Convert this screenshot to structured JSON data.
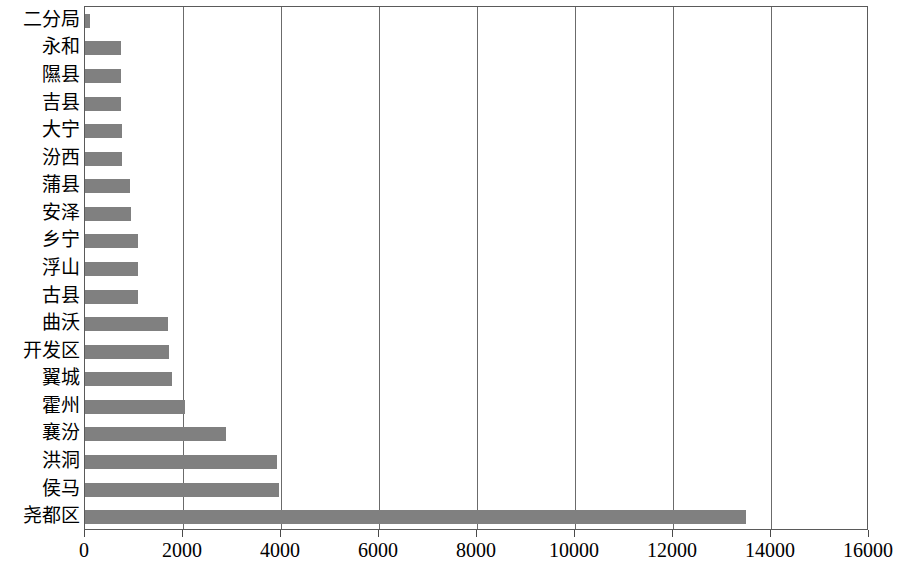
{
  "chart_data": {
    "type": "bar",
    "orientation": "horizontal",
    "title": "",
    "subtitle": "",
    "xlabel": "",
    "ylabel": "",
    "categories": [
      "二分局",
      "永和",
      "隰县",
      "吉县",
      "大宁",
      "汾西",
      "蒲县",
      "安泽",
      "乡宁",
      "浮山",
      "古县",
      "曲沃",
      "开发区",
      "翼城",
      "霍州",
      "襄汾",
      "洪洞",
      "侯马",
      "尧都区"
    ],
    "values": [
      110,
      735,
      740,
      740,
      745,
      745,
      925,
      930,
      1080,
      1085,
      1090,
      1700,
      1710,
      1780,
      2050,
      2880,
      3920,
      3960,
      13490
    ],
    "xlim": [
      0,
      16000
    ],
    "ylim": null,
    "xticks": [
      0,
      2000,
      4000,
      6000,
      8000,
      10000,
      12000,
      14000,
      16000
    ],
    "xticklabels": [
      "0",
      "2000",
      "4000",
      "6000",
      "8000",
      "10000",
      "12000",
      "14000",
      "16000"
    ],
    "grid": "vertical",
    "gridlines_at": [
      2000,
      4000,
      6000,
      8000,
      10000,
      12000,
      14000
    ],
    "legend": null,
    "legend_position": "none",
    "bar_color": "#808080",
    "axis_color": "#5a5a5a",
    "grid_color": "#6b6b6b",
    "background": "#ffffff",
    "annotations": []
  }
}
